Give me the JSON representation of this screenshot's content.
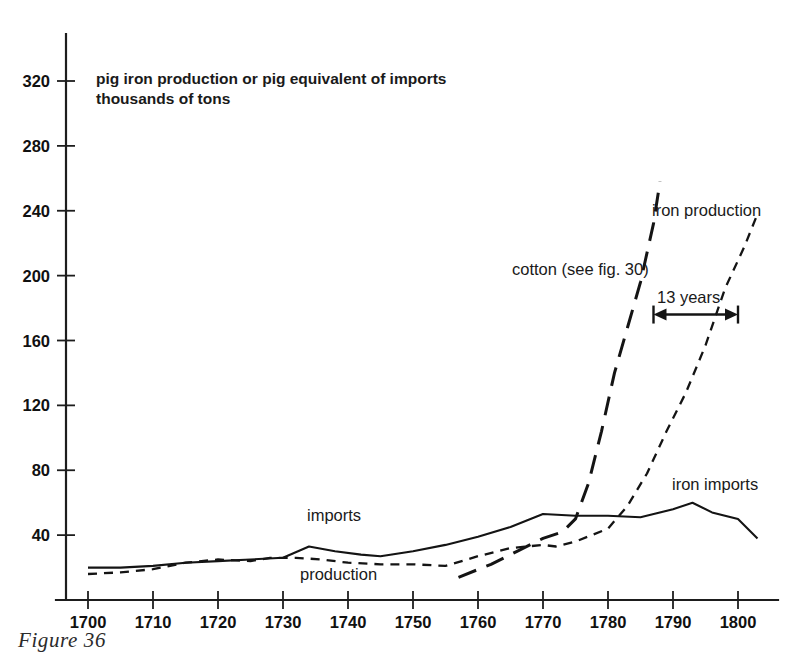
{
  "figure": {
    "caption": "Figure 36",
    "note_line1": "pig iron production or pig equivalent of imports",
    "note_line2": "thousands of tons"
  },
  "labels": {
    "iron_production": "iron production",
    "iron_imports": "iron imports",
    "cotton": "cotton (see fig. 30)",
    "imports_inline": "imports",
    "production_inline": "production",
    "lag_annotation": "13 years"
  },
  "chart_data": {
    "type": "line",
    "title": "",
    "subtitle": "pig iron production or pig equivalent of imports / thousands of tons",
    "xlabel": "",
    "ylabel": "pig iron production or pig equivalent of imports, thousands of tons",
    "xlim": [
      1697,
      1805
    ],
    "ylim": [
      0,
      340
    ],
    "xticks": [
      1700,
      1710,
      1720,
      1730,
      1740,
      1750,
      1760,
      1770,
      1780,
      1790,
      1800
    ],
    "yticks": [
      40,
      80,
      120,
      160,
      200,
      240,
      280,
      320
    ],
    "grid": false,
    "legend": "inline-annotations",
    "series": [
      {
        "name": "iron imports",
        "style": "solid",
        "points": [
          [
            1700,
            20
          ],
          [
            1705,
            20
          ],
          [
            1710,
            21
          ],
          [
            1715,
            23
          ],
          [
            1720,
            24
          ],
          [
            1725,
            25
          ],
          [
            1730,
            26
          ],
          [
            1734,
            33
          ],
          [
            1738,
            30
          ],
          [
            1742,
            28
          ],
          [
            1745,
            27
          ],
          [
            1750,
            30
          ],
          [
            1755,
            34
          ],
          [
            1760,
            39
          ],
          [
            1765,
            45
          ],
          [
            1770,
            53
          ],
          [
            1775,
            52
          ],
          [
            1780,
            52
          ],
          [
            1785,
            51
          ],
          [
            1790,
            56
          ],
          [
            1793,
            60
          ],
          [
            1796,
            54
          ],
          [
            1800,
            50
          ],
          [
            1803,
            38
          ]
        ]
      },
      {
        "name": "iron production",
        "style": "short-dash",
        "points": [
          [
            1700,
            16
          ],
          [
            1705,
            17
          ],
          [
            1710,
            19
          ],
          [
            1715,
            23
          ],
          [
            1720,
            25
          ],
          [
            1725,
            24
          ],
          [
            1728,
            26
          ],
          [
            1732,
            26
          ],
          [
            1736,
            25
          ],
          [
            1740,
            23
          ],
          [
            1745,
            22
          ],
          [
            1750,
            22
          ],
          [
            1755,
            21
          ],
          [
            1760,
            27
          ],
          [
            1765,
            32
          ],
          [
            1770,
            34
          ],
          [
            1772,
            33
          ],
          [
            1775,
            36
          ],
          [
            1780,
            44
          ],
          [
            1783,
            58
          ],
          [
            1786,
            78
          ],
          [
            1789,
            104
          ],
          [
            1792,
            128
          ],
          [
            1795,
            157
          ],
          [
            1798,
            192
          ],
          [
            1801,
            218
          ],
          [
            1803,
            238
          ]
        ]
      },
      {
        "name": "cotton (see fig. 30)",
        "style": "long-dash",
        "points": [
          [
            1757,
            14
          ],
          [
            1762,
            22
          ],
          [
            1766,
            30
          ],
          [
            1770,
            38
          ],
          [
            1773,
            42
          ],
          [
            1775,
            50
          ],
          [
            1777,
            72
          ],
          [
            1779,
            104
          ],
          [
            1781,
            140
          ],
          [
            1783,
            168
          ],
          [
            1785,
            196
          ],
          [
            1787,
            232
          ],
          [
            1788,
            258
          ]
        ]
      }
    ],
    "annotations": [
      {
        "text": "13 years",
        "type": "double-arrow",
        "y_value": 176,
        "x_from": 1787,
        "x_to": 1800
      }
    ]
  }
}
